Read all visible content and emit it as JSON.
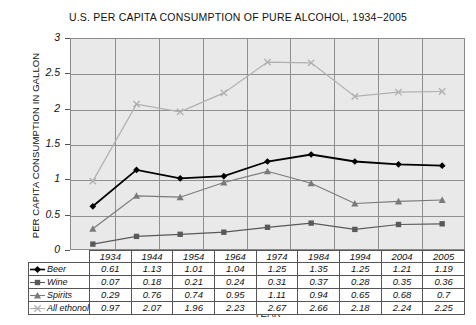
{
  "chart_data": {
    "type": "line",
    "title": "U.S. PER CAPITA CONSUMPTION OF PURE ALCOHOL, 1934−2005",
    "xlabel": "YEAR",
    "ylabel": "PER CAPITA CONSUMPTION IN GALLON",
    "categories": [
      "1934",
      "1944",
      "1954",
      "1964",
      "1974",
      "1984",
      "1994",
      "2004",
      "2005"
    ],
    "yticks": [
      "0",
      "0.5",
      "1",
      "1.5",
      "2",
      "2.5",
      "3"
    ],
    "ylim": [
      0,
      3
    ],
    "grid": true,
    "legend_position": "table-row-labels",
    "series": [
      {
        "name": "Beer",
        "marker": "diamond",
        "color": "#000000",
        "values": [
          0.61,
          1.13,
          1.01,
          1.04,
          1.25,
          1.35,
          1.25,
          1.21,
          1.19
        ],
        "labels": [
          "0.61",
          "1.13",
          "1.01",
          "1.04",
          "1.25",
          "1.35",
          "1.25",
          "1.21",
          "1.19"
        ]
      },
      {
        "name": "Wine",
        "marker": "square",
        "color": "#595959",
        "values": [
          0.07,
          0.18,
          0.21,
          0.24,
          0.31,
          0.37,
          0.28,
          0.35,
          0.36
        ],
        "labels": [
          "0.07",
          "0.18",
          "0.21",
          "0.24",
          "0.31",
          "0.37",
          "0.28",
          "0.35",
          "0.36"
        ]
      },
      {
        "name": "Spirits",
        "marker": "triangle",
        "color": "#7a7a7a",
        "values": [
          0.29,
          0.76,
          0.74,
          0.95,
          1.11,
          0.94,
          0.65,
          0.68,
          0.7
        ],
        "labels": [
          "0.29",
          "0.76",
          "0.74",
          "0.95",
          "1.11",
          "0.94",
          "0.65",
          "0.68",
          "0.7"
        ]
      },
      {
        "name": "All ethonol",
        "marker": "x",
        "color": "#b0b0b0",
        "values": [
          0.97,
          2.07,
          1.96,
          2.23,
          2.67,
          2.66,
          2.18,
          2.24,
          2.25
        ],
        "labels": [
          "0.97",
          "2.07",
          "1.96",
          "2.23",
          "2.67",
          "2.66",
          "2.18",
          "2.24",
          "2.25"
        ]
      }
    ]
  },
  "colors": {
    "plot_background": "#e9e9e9",
    "grid": "#8f8f8f",
    "axis": "#555555"
  }
}
